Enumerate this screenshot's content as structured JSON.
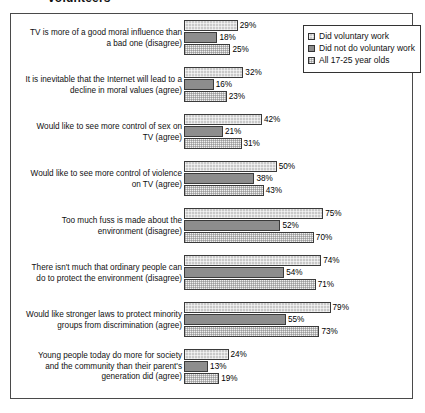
{
  "title": "volunteers",
  "legend": {
    "position": "top-right",
    "items": [
      {
        "label": "Did voluntary work",
        "series_key": "did_voluntary_work",
        "swatch": "s0"
      },
      {
        "label": "Did not do voluntary work",
        "series_key": "did_not_do_voluntary_work",
        "swatch": "s1"
      },
      {
        "label": "All 17-25 year olds",
        "series_key": "all_17_25_year_olds",
        "swatch": "s2"
      }
    ]
  },
  "chart_data": {
    "type": "bar",
    "orientation": "horizontal",
    "title": "volunteers",
    "xlabel": "",
    "ylabel": "",
    "xlim": [
      0,
      100
    ],
    "grid": false,
    "value_suffix": "%",
    "legend_position": "top-right",
    "categories": [
      "TV is more of a good moral influence than a bad one (disagree)",
      "It is inevitable that the Internet will lead to a decline in moral values (agree)",
      "Would like to see more control of sex on TV (agree)",
      "Would like to see more control of violence on TV (agree)",
      "Too much fuss is made about the environment (disagree)",
      "There isn't much that ordinary people can do to protect the environment (disagree)",
      "Would like stronger laws to protect minority groups from discrimination (agree)",
      "Young people today do more for society and the community than their parent's generation did (agree)"
    ],
    "series": [
      {
        "name": "Did voluntary work",
        "values": [
          29,
          32,
          42,
          50,
          75,
          74,
          79,
          24
        ]
      },
      {
        "name": "Did not do voluntary work",
        "values": [
          18,
          16,
          21,
          38,
          52,
          54,
          55,
          13
        ]
      },
      {
        "name": "All 17-25 year olds",
        "values": [
          25,
          23,
          31,
          43,
          70,
          71,
          73,
          19
        ]
      }
    ],
    "labels": [
      [
        "29%",
        "18%",
        "25%"
      ],
      [
        "32%",
        "16%",
        "23%"
      ],
      [
        "42%",
        "21%",
        "31%"
      ],
      [
        "50%",
        "38%",
        "43%"
      ],
      [
        "75%",
        "52%",
        "70%"
      ],
      [
        "74%",
        "54%",
        "71%"
      ],
      [
        "79%",
        "55%",
        "73%"
      ],
      [
        "24%",
        "13%",
        "19%"
      ]
    ]
  },
  "groups": [
    {
      "label_lines": [
        "TV is more of a good moral influence than",
        "a bad one (disagree)"
      ],
      "values": [
        29,
        18,
        25
      ],
      "labels": [
        "29%",
        "18%",
        "25%"
      ]
    },
    {
      "label_lines": [
        "It is inevitable that the Internet will lead to a",
        "decline in moral values (agree)"
      ],
      "values": [
        32,
        16,
        23
      ],
      "labels": [
        "32%",
        "16%",
        "23%"
      ]
    },
    {
      "label_lines": [
        "Would like to see more control of sex on",
        "TV (agree)"
      ],
      "values": [
        42,
        21,
        31
      ],
      "labels": [
        "42%",
        "21%",
        "31%"
      ]
    },
    {
      "label_lines": [
        "Would like to see more control of violence",
        "on TV (agree)"
      ],
      "values": [
        50,
        38,
        43
      ],
      "labels": [
        "50%",
        "38%",
        "43%"
      ]
    },
    {
      "label_lines": [
        "Too much fuss is made about the",
        "environment (disagree)"
      ],
      "values": [
        75,
        52,
        70
      ],
      "labels": [
        "75%",
        "52%",
        "70%"
      ]
    },
    {
      "label_lines": [
        "There isn't much that ordinary people can",
        "do to protect the environment (disagree)"
      ],
      "values": [
        74,
        54,
        71
      ],
      "labels": [
        "74%",
        "54%",
        "71%"
      ]
    },
    {
      "label_lines": [
        "Would like stronger laws to protect minority",
        "groups from discrimination (agree)"
      ],
      "values": [
        79,
        55,
        73
      ],
      "labels": [
        "79%",
        "55%",
        "73%"
      ]
    },
    {
      "label_lines": [
        "Young people today do more for society",
        "and the community than their parent's",
        "generation did (agree)"
      ],
      "values": [
        24,
        13,
        19
      ],
      "labels": [
        "24%",
        "13%",
        "19%"
      ]
    }
  ],
  "colors": {
    "series1_fill": "#c9c9c9",
    "series2_fill": "#8d8d8d",
    "series3_fill": "#f0f0f0",
    "bar_border": "#3a3a3a",
    "frame_border": "#4a4a4a",
    "text": "#111111"
  }
}
